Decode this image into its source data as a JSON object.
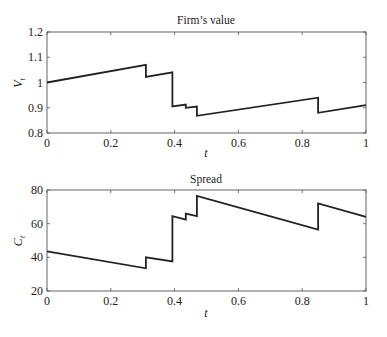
{
  "chart_data": [
    {
      "type": "line",
      "title": "Firm’s value",
      "xlabel": "t",
      "ylabel": "V",
      "ylabel_sub": "t",
      "xlim": [
        0,
        1
      ],
      "ylim": [
        0.8,
        1.2
      ],
      "xticks": [
        "0",
        "0.2",
        "0.4",
        "0.6",
        "0.8",
        "1"
      ],
      "yticks": [
        "0.8",
        "0.9",
        "1",
        "1.1",
        "1.2"
      ],
      "grid": false,
      "series": [
        {
          "name": "V_t",
          "x": [
            0,
            0.31,
            0.31,
            0.393,
            0.393,
            0.435,
            0.435,
            0.47,
            0.47,
            0.85,
            0.85,
            1.0
          ],
          "y": [
            1.0,
            1.07,
            1.022,
            1.04,
            0.905,
            0.913,
            0.9,
            0.905,
            0.868,
            0.94,
            0.88,
            0.91
          ]
        }
      ]
    },
    {
      "type": "line",
      "title": "Spread",
      "xlabel": "t",
      "ylabel": "C",
      "ylabel_sub": "t",
      "xlim": [
        0,
        1
      ],
      "ylim": [
        20,
        80
      ],
      "xticks": [
        "0",
        "0.2",
        "0.4",
        "0.6",
        "0.8",
        "1"
      ],
      "yticks": [
        "20",
        "40",
        "60",
        "80"
      ],
      "grid": false,
      "series": [
        {
          "name": "C_t",
          "x": [
            0,
            0.31,
            0.31,
            0.393,
            0.393,
            0.435,
            0.435,
            0.47,
            0.47,
            0.85,
            0.85,
            1.0
          ],
          "y": [
            43.5,
            33.5,
            40.0,
            37.5,
            64.5,
            62.5,
            66.0,
            64.5,
            76.5,
            56.5,
            72.0,
            64.0
          ]
        }
      ]
    }
  ],
  "colors": {
    "line": "#222222",
    "axes": "#555555",
    "background": "#ffffff"
  }
}
